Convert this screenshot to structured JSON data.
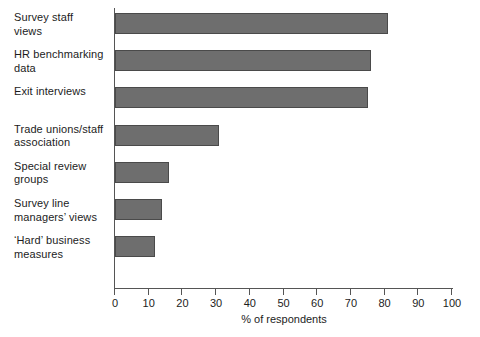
{
  "chart_data": {
    "type": "bar",
    "orientation": "horizontal",
    "title": "",
    "xlabel": "% of respondents",
    "ylabel": "",
    "xlim": [
      0,
      100
    ],
    "xticks": [
      0,
      10,
      20,
      30,
      40,
      50,
      60,
      70,
      80,
      90,
      100
    ],
    "grid": false,
    "legend": false,
    "bar_color": "#6e6e6e",
    "bar_edge_color": "#4a4a4a",
    "categories": [
      "Survey staff\nviews",
      "HR benchmarking\ndata",
      "Exit interviews",
      "Trade unions/staff\nassociation",
      "Special review\ngroups",
      "Survey line\nmanagers’ views",
      "‘Hard’ business\nmeasures"
    ],
    "values": [
      81,
      76,
      75,
      31,
      16,
      14,
      12
    ]
  },
  "axis": {
    "x_title": "% of respondents",
    "tick_labels": [
      "0",
      "10",
      "20",
      "30",
      "40",
      "50",
      "60",
      "70",
      "80",
      "90",
      "100"
    ]
  },
  "caption": ""
}
